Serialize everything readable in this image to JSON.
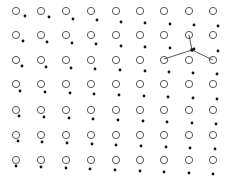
{
  "diagram": {
    "title": "",
    "colors": {
      "background": "#ffffff",
      "circle_stroke": "#555555",
      "dot_fill": "#111111",
      "line": "#444444"
    },
    "grid": {
      "columns_x": [
        16,
        41,
        66,
        91,
        116,
        140,
        164,
        189,
        213
      ],
      "rows_y": [
        11,
        35,
        60,
        84,
        110,
        135,
        160
      ],
      "circle_radius": 3.6
    },
    "dots": [
      [
        [
          25,
          16
        ],
        [
          49,
          17
        ],
        [
          73,
          19
        ],
        [
          97,
          20
        ],
        [
          121,
          22
        ],
        [
          145,
          23
        ],
        [
          170,
          24
        ],
        [
          194,
          25
        ],
        [
          218,
          26
        ]
      ],
      [
        [
          23,
          41
        ],
        [
          47,
          42
        ],
        [
          72,
          43
        ],
        [
          96,
          44
        ],
        [
          121,
          46
        ],
        [
          145,
          47
        ],
        [
          170,
          48
        ],
        [
          194,
          49
        ],
        [
          218,
          51
        ]
      ],
      [
        [
          22,
          66
        ],
        [
          46,
          67
        ],
        [
          71,
          68
        ],
        [
          95,
          69
        ],
        [
          120,
          70
        ],
        [
          145,
          71
        ],
        [
          169,
          72
        ],
        [
          193,
          73
        ],
        [
          217,
          74
        ]
      ],
      [
        [
          20,
          91
        ],
        [
          45,
          92
        ],
        [
          70,
          93
        ],
        [
          94,
          94
        ],
        [
          119,
          95
        ],
        [
          144,
          96
        ],
        [
          168,
          97
        ],
        [
          193,
          98
        ],
        [
          217,
          99
        ]
      ],
      [
        [
          19,
          116
        ],
        [
          44,
          117
        ],
        [
          69,
          118
        ],
        [
          93,
          119
        ],
        [
          118,
          120
        ],
        [
          143,
          121
        ],
        [
          167,
          122
        ],
        [
          192,
          123
        ],
        [
          216,
          124
        ]
      ],
      [
        [
          18,
          141
        ],
        [
          42,
          142
        ],
        [
          67,
          143
        ],
        [
          92,
          144
        ],
        [
          116,
          145
        ],
        [
          141,
          146
        ],
        [
          166,
          147
        ],
        [
          190,
          148
        ],
        [
          215,
          149
        ]
      ],
      [
        [
          16,
          166
        ],
        [
          41,
          167
        ],
        [
          66,
          168
        ],
        [
          90,
          169
        ],
        [
          115,
          170
        ],
        [
          140,
          171
        ],
        [
          164,
          172
        ],
        [
          189,
          173
        ],
        [
          213,
          174
        ]
      ]
    ],
    "highlight": {
      "center": [
        192,
        50
      ],
      "targets": [
        [
          164,
          59
        ],
        [
          189,
          35
        ],
        [
          213,
          60
        ]
      ]
    }
  }
}
